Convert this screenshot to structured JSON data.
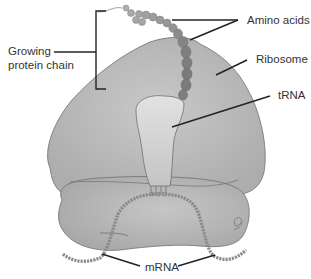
{
  "diagram": {
    "labels": {
      "growing_line1": "Growing",
      "growing_line2": "protein chain",
      "amino_acids": "Amino acids",
      "ribosome": "Ribosome",
      "trna": "tRNA",
      "mrna": "mRNA"
    },
    "colors": {
      "background": "#ffffff",
      "large_subunit": "#b9b9b9",
      "small_subunit": "#b3b3b3",
      "outline": "#6e6e6e",
      "trna": "#d6d6d6",
      "amino_dark": "#7f7f7f",
      "amino_light": "#a7a7a7",
      "mrna": "#8a8a8a",
      "leader_line": "#222222",
      "text": "#333333"
    }
  }
}
